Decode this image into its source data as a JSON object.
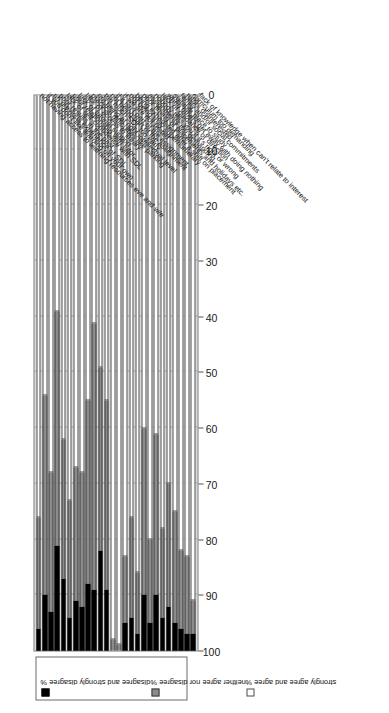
{
  "chart_data": {
    "type": "bar",
    "subtype": "stacked-horizontal-percent",
    "title": "",
    "xlabel": "",
    "ylabel": "",
    "ylim": [
      0,
      100
    ],
    "axis_orientation": "bars drawn horizontally; value axis reversed, 100 at left to 0 at right",
    "grid": true,
    "legend_position": "top-left",
    "tick_labels": [
      "100",
      "90",
      "80",
      "70",
      "60",
      "50",
      "40",
      "30",
      "20",
      "10",
      "0"
    ],
    "tick_values": [
      100,
      90,
      80,
      70,
      60,
      50,
      40,
      30,
      20,
      10,
      0
    ],
    "legend_entries": [
      "disagree and strongly disagree %",
      "neither agree nor disagree %",
      "strongly agree and agree %"
    ],
    "categories": [
      "not having access to learning resources eve and w/e",
      "if you don't like learning on your own",
      "no previous experience of SDL",
      "poor results in the past",
      "lack of self-confidence with SDL",
      "poor relationship with tutor",
      "lack of tutorial support",
      "lack of access to library",
      "practical difficulties like parking",
      "not being at right intellectual level",
      "too much SDL too early",
      "not being part of the assignment",
      "if it isn't part of the assignment",
      "if we are not tested",
      "not being truly supernumerary",
      "being exhausted after a shift on placement",
      "poor timing of placements and holidays etc.",
      "assignments too demanding",
      "nobody tells you if it's right or wrong",
      "lack of guidance or direction",
      "when others get away with doing nothing",
      "suitable place to study",
      "family and/or social commitments",
      "tutors disinterested",
      "curriculum too demanding",
      "lack of knowledge when can't relate to interest"
    ],
    "series": [
      {
        "name": "strongly agree and agree %",
        "color": "#ffffff",
        "values": [
          76,
          54,
          68,
          39,
          62,
          73,
          67,
          68,
          55,
          41,
          49,
          55,
          98,
          99,
          83,
          76,
          86,
          60,
          80,
          61,
          78,
          70,
          75,
          82,
          83,
          91
        ]
      },
      {
        "name": "neither agree nor disagree %",
        "color": "#8c8c8c",
        "values": [
          20,
          36,
          25,
          42,
          25,
          21,
          24,
          24,
          33,
          48,
          33,
          34,
          2,
          1,
          12,
          18,
          11,
          30,
          15,
          29,
          16,
          22,
          20,
          14,
          14,
          6
        ]
      },
      {
        "name": "disagree and strongly disagree %",
        "color": "#000000",
        "values": [
          4,
          10,
          7,
          19,
          13,
          6,
          9,
          8,
          12,
          11,
          18,
          11,
          0,
          0,
          5,
          6,
          3,
          10,
          5,
          10,
          6,
          8,
          5,
          4,
          3,
          3
        ]
      }
    ]
  },
  "legend": {
    "entries": [
      {
        "label": "disagree and strongly disagree %",
        "swatch": "black-square-icon"
      },
      {
        "label": "neither agree nor disagree %",
        "swatch": "gray-square-icon"
      },
      {
        "label": "strongly agree and agree %",
        "swatch": "white-square-icon"
      }
    ]
  }
}
